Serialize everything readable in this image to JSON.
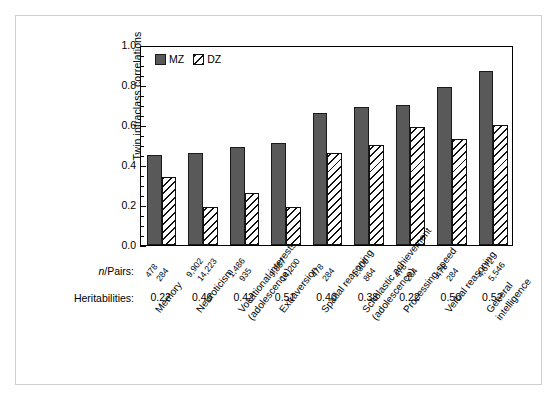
{
  "figure": {
    "y_axis_title": "Twin intraclass correlations",
    "npairs_row_label_prefix": "n",
    "npairs_row_label_suffix": "/Pairs:",
    "heritabilities_row_label": "Heritabilities:",
    "legend": [
      {
        "key": "mz",
        "label": "MZ",
        "swatch": "solid-dark-gray-square"
      },
      {
        "key": "dz",
        "label": "DZ",
        "swatch": "white-diagonal-hatched-square"
      }
    ],
    "colors": {
      "mz_fill": "#595959",
      "mz_stroke": "#1a1a1a",
      "dz_fill": "#ffffff",
      "dz_hatch": "#111111",
      "axis": "#000000",
      "frame": "#cfcfcf",
      "background": "#ffffff"
    }
  },
  "chart_data": {
    "type": "bar",
    "title": "",
    "xlabel": "",
    "ylabel": "Twin intraclass correlations",
    "ylim": [
      0.0,
      1.0
    ],
    "ytick_labels": [
      "0.0",
      "0.2",
      "0.4",
      "0.6",
      "0.8",
      "1.0"
    ],
    "ytick_values": [
      0.0,
      0.2,
      0.4,
      0.6,
      0.8,
      1.0
    ],
    "yminor_step": 0.05,
    "grid": false,
    "legend_position": "top-left inside axes",
    "categories": [
      "Memory",
      "Neuroticism",
      "Vocational interests (adolescence)",
      "Extraversion",
      "Spatial reasoning",
      "Scholastic achievement (adolescence)",
      "Processing speed",
      "Verbal reasoning",
      "General intelligence"
    ],
    "category_lines": [
      [
        "Memory",
        ""
      ],
      [
        "Neuroticism",
        ""
      ],
      [
        "Vocational interests",
        "(adolescence)"
      ],
      [
        "Extraversion",
        ""
      ],
      [
        "Spatial reasoning",
        ""
      ],
      [
        "Scholastic achievement",
        "(adolescence)"
      ],
      [
        "Processing speed",
        ""
      ],
      [
        "Verbal reasoning",
        ""
      ],
      [
        "General",
        "intelligence"
      ]
    ],
    "series": [
      {
        "name": "MZ",
        "values": [
          0.45,
          0.46,
          0.49,
          0.51,
          0.66,
          0.69,
          0.7,
          0.79,
          0.87
        ]
      },
      {
        "name": "DZ",
        "values": [
          0.34,
          0.19,
          0.26,
          0.19,
          0.46,
          0.5,
          0.59,
          0.53,
          0.6
        ]
      }
    ],
    "n_pairs": {
      "mz": [
        "478",
        "9,902",
        "1,486",
        "9,887",
        "478",
        "1,300",
        "478",
        "478",
        "4,672"
      ],
      "dz": [
        "284",
        "14,223",
        "935",
        "14,200",
        "284",
        "864",
        "284",
        "284",
        "5,546"
      ]
    },
    "heritabilities": [
      "0.22",
      "0.46",
      "0.42",
      "0.51",
      "0.40",
      "0.38",
      "0.22",
      "0.50",
      "0.52"
    ]
  }
}
